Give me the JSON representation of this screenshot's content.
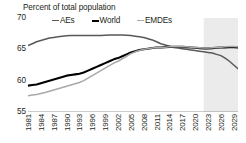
{
  "chart_data": {
    "type": "line",
    "title": "Percent of total population",
    "ylabel": "",
    "xlabel": "",
    "ylim": [
      55,
      70
    ],
    "yticks": [
      55,
      60,
      65,
      70
    ],
    "grid": false,
    "legend_position": "top",
    "forecast_shading": {
      "start_year": 2022,
      "end_year": 2030,
      "color": "#ebebeb"
    },
    "x": [
      1981,
      1982,
      1983,
      1984,
      1985,
      1986,
      1987,
      1988,
      1989,
      1990,
      1991,
      1992,
      1993,
      1994,
      1995,
      1996,
      1997,
      1998,
      1999,
      2000,
      2001,
      2002,
      2003,
      2004,
      2005,
      2006,
      2007,
      2008,
      2009,
      2010,
      2011,
      2012,
      2013,
      2014,
      2015,
      2016,
      2017,
      2018,
      2019,
      2020,
      2021,
      2022,
      2023,
      2024,
      2025,
      2026,
      2027,
      2028,
      2029,
      2030
    ],
    "xticks": [
      1981,
      1984,
      1987,
      1990,
      1993,
      1996,
      1999,
      2002,
      2005,
      2008,
      2011,
      2014,
      2017,
      2020,
      2023,
      2026,
      2029
    ],
    "series": [
      {
        "name": "AEs",
        "color": "#58585a",
        "width": 1.5,
        "values": [
          65.6,
          65.9,
          66.2,
          66.4,
          66.6,
          66.8,
          66.9,
          67.0,
          67.1,
          67.15,
          67.2,
          67.2,
          67.2,
          67.2,
          67.2,
          67.2,
          67.2,
          67.2,
          67.25,
          67.3,
          67.3,
          67.3,
          67.3,
          67.25,
          67.2,
          67.1,
          67.0,
          66.9,
          66.7,
          66.5,
          66.2,
          65.9,
          65.7,
          65.5,
          65.3,
          65.2,
          65.1,
          65.0,
          64.9,
          64.8,
          64.7,
          64.6,
          64.5,
          64.4,
          64.2,
          64.0,
          63.6,
          63.1,
          62.5,
          61.9
        ]
      },
      {
        "name": "World",
        "color": "#000000",
        "width": 2.1,
        "values": [
          59.2,
          59.3,
          59.4,
          59.6,
          59.8,
          60.0,
          60.2,
          60.4,
          60.6,
          60.8,
          60.9,
          61.0,
          61.1,
          61.3,
          61.6,
          61.9,
          62.2,
          62.5,
          62.8,
          63.1,
          63.4,
          63.6,
          63.9,
          64.2,
          64.5,
          64.7,
          64.9,
          65.0,
          65.1,
          65.2,
          65.3,
          65.3,
          65.35,
          65.4,
          65.4,
          65.4,
          65.4,
          65.35,
          65.3,
          65.25,
          65.2,
          65.15,
          65.15,
          65.2,
          65.25,
          65.3,
          65.3,
          65.35,
          65.35,
          65.3
        ]
      },
      {
        "name": "EMDEs",
        "color": "#a7a9ac",
        "width": 1.5,
        "values": [
          57.6,
          57.7,
          57.8,
          57.95,
          58.1,
          58.3,
          58.5,
          58.7,
          58.9,
          59.1,
          59.3,
          59.5,
          59.7,
          60.0,
          60.4,
          60.8,
          61.2,
          61.6,
          62.0,
          62.4,
          62.8,
          63.1,
          63.5,
          63.9,
          64.3,
          64.6,
          64.8,
          65.0,
          65.1,
          65.2,
          65.3,
          65.3,
          65.35,
          65.4,
          65.4,
          65.4,
          65.4,
          65.4,
          65.35,
          65.3,
          65.25,
          65.2,
          65.2,
          65.25,
          65.3,
          65.35,
          65.4,
          65.45,
          65.45,
          65.4
        ]
      }
    ]
  },
  "ytick_labels": [
    "70",
    "65",
    "60",
    "55"
  ],
  "xtick_labels": [
    "1981",
    "1984",
    "1987",
    "1990",
    "1993",
    "1996",
    "1999",
    "2002",
    "2005",
    "2008",
    "2011",
    "2014",
    "2017",
    "2020",
    "2023",
    "2026",
    "2029"
  ],
  "legend": [
    {
      "label": "AEs",
      "color": "#58585a"
    },
    {
      "label": "World",
      "color": "#000000"
    },
    {
      "label": "EMDEs",
      "color": "#a7a9ac"
    }
  ]
}
